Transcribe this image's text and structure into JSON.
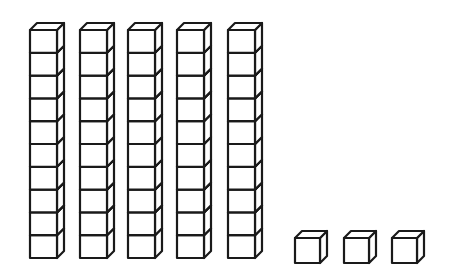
{
  "figure": {
    "title": "",
    "represented_value": 53,
    "stroke_color": "#1a1a1a",
    "fill_color": "#ffffff",
    "background": "#ffffff"
  },
  "tens_rods": {
    "count": 5,
    "cubes_per_rod": 10,
    "rods": [
      {
        "x": 30,
        "label": "ten-rod-1"
      },
      {
        "x": 80,
        "label": "ten-rod-2"
      },
      {
        "x": 128,
        "label": "ten-rod-3"
      },
      {
        "x": 177,
        "label": "ten-rod-4"
      },
      {
        "x": 228,
        "label": "ten-rod-5"
      }
    ],
    "top_y": 30,
    "cube_width": 27,
    "cube_height": 22.8,
    "depth_dx": 7,
    "depth_dy": 7
  },
  "ones_cubes": {
    "count": 3,
    "cubes": [
      {
        "x": 295,
        "label": "unit-cube-1"
      },
      {
        "x": 344,
        "label": "unit-cube-2"
      },
      {
        "x": 392,
        "label": "unit-cube-3"
      }
    ],
    "top_y": 238,
    "size": 25,
    "depth_dx": 7,
    "depth_dy": 7
  }
}
